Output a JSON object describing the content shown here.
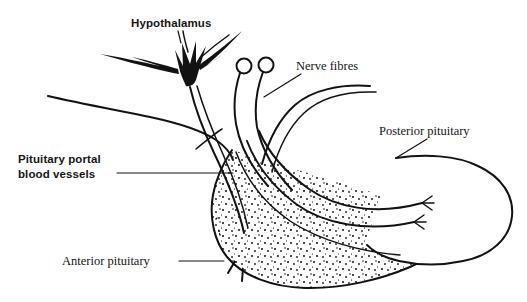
{
  "figure": {
    "background_color": "#ffffff",
    "ink_color": "#121212",
    "labels": {
      "hypothalamus": "Hypothalamus",
      "nerve_fibres": "Nerve fibres",
      "posterior_pituitary": "Posterior pituitary",
      "pituitary_portal_line1": "Pituitary portal",
      "pituitary_portal_line2": "blood vessels",
      "anterior_pituitary": "Anterior pituitary"
    },
    "structures": [
      {
        "name": "hypothalamus-neuron",
        "description": "multipolar neuron cell body with radiating dendrites"
      },
      {
        "name": "neurosecretory-cell-bodies",
        "description": "two small open circles"
      },
      {
        "name": "anterior-pituitary-lobe",
        "description": "stippled lobe with branching portal vessels"
      },
      {
        "name": "posterior-pituitary-lobe",
        "description": "unshaded rounded lobe with nerve terminals"
      }
    ]
  }
}
